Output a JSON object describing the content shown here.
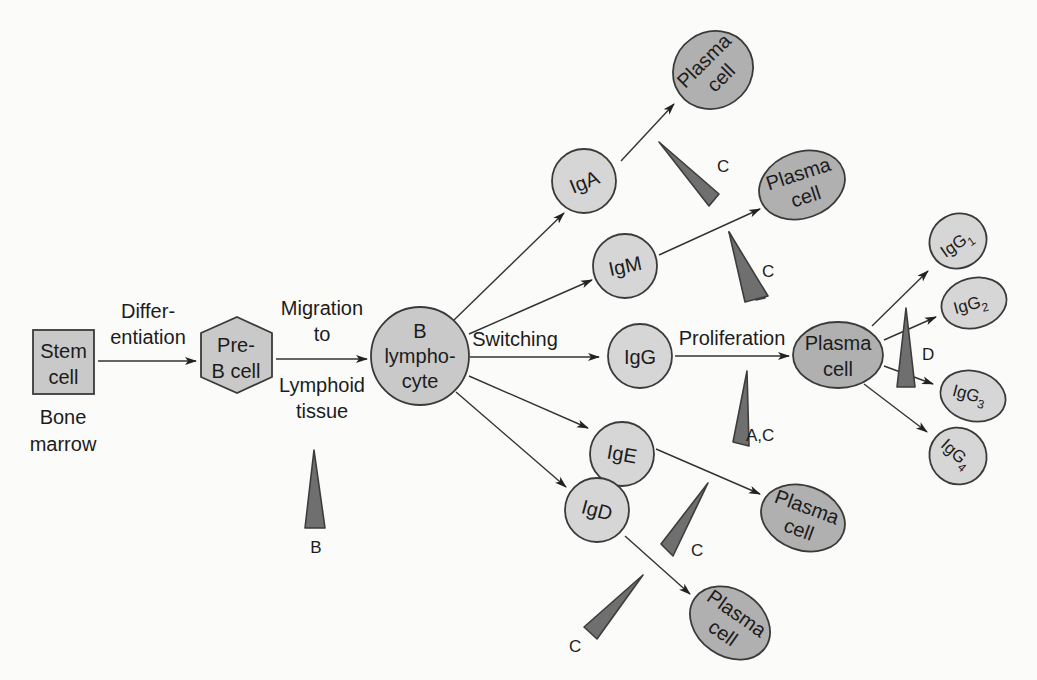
{
  "diagram": {
    "stages": {
      "stem_cell": {
        "line1": "Stem",
        "line2": "cell",
        "location1": "Bone",
        "location2": "marrow"
      },
      "pre_b_cell": {
        "line1": "Pre-",
        "line2": "B cell"
      },
      "b_lymphocyte": {
        "line1": "B",
        "line2": "lympho-",
        "line3": "cyte"
      }
    },
    "transitions": {
      "differentiation": {
        "line1": "Differ-",
        "line2": "entiation"
      },
      "migration": {
        "line1": "Migration",
        "line2": "to",
        "line3": "Lymphoid",
        "line4": "tissue"
      },
      "switching": "Switching",
      "proliferation": "Proliferation"
    },
    "isotypes": {
      "iga": "IgA",
      "igm": "IgM",
      "igg": "IgG",
      "ige": "IgE",
      "igd": "IgD"
    },
    "plasma_cell": {
      "line1": "Plasma",
      "line2": "cell"
    },
    "igg_subclasses": [
      {
        "base": "IgG",
        "sub": "1"
      },
      {
        "base": "IgG",
        "sub": "2"
      },
      {
        "base": "IgG",
        "sub": "3"
      },
      {
        "base": "IgG",
        "sub": "4"
      }
    ],
    "defect_markers": {
      "b": "B",
      "c_iga": "C",
      "c_igm": "C",
      "ac_igg": "A,C",
      "c_ige": "C",
      "c_igd": "C",
      "d_subclass": "D"
    }
  },
  "colors": {
    "background": "#fbfbfa",
    "node_fill": "#c9c9c9",
    "plasma_fill": "#b0b0b0",
    "wedge_fill": "#6f6f6f",
    "stroke": "#3a3a3a"
  }
}
